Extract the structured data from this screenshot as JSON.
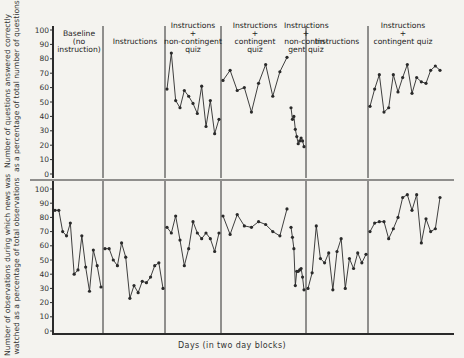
{
  "chart_data": [
    {
      "type": "line",
      "panel": "top",
      "ylabel": "Number of questions answered correctly as a percentage of total number of questions",
      "ylabel_lines": [
        "Number of questions answered correctly",
        "as a percentage of total number of questions"
      ],
      "ylim": [
        0,
        100
      ],
      "yticks": [
        0,
        10,
        20,
        30,
        40,
        50,
        60,
        70,
        80,
        90,
        100
      ],
      "grid": false,
      "phases": [
        {
          "label": "Baseline (no instruction)",
          "values": []
        },
        {
          "label": "Instructions",
          "values": []
        },
        {
          "label": "Instructions + non-contingent quiz",
          "values": [
            59,
            84,
            51,
            46,
            58,
            54,
            49,
            42,
            61,
            33,
            51,
            28,
            38
          ]
        },
        {
          "label": "Instructions + contingent quiz",
          "values": [
            65,
            72,
            58,
            60,
            43,
            63,
            76,
            54,
            71,
            81
          ]
        },
        {
          "label": "Instructions + non-contingent quiz",
          "values": [
            46,
            38,
            40,
            31,
            26,
            21,
            23,
            25,
            23,
            19
          ]
        },
        {
          "label": "Instructions",
          "values": []
        },
        {
          "label": "Instructions + contingent quiz",
          "values": [
            47,
            59,
            69,
            43,
            46,
            69,
            57,
            67,
            76,
            56,
            67,
            64,
            63,
            72,
            75,
            72
          ]
        }
      ]
    },
    {
      "type": "line",
      "panel": "bottom",
      "ylabel": "Number of observations during which news was watched as a percentage of total observations",
      "ylabel_lines": [
        "Number of observations during which news was",
        "watched as a percentage of total observations"
      ],
      "xlabel": "Days (in two day blocks)",
      "ylim": [
        0,
        100
      ],
      "yticks": [
        0,
        10,
        20,
        30,
        40,
        50,
        60,
        70,
        80,
        90,
        100
      ],
      "grid": false,
      "phases": [
        {
          "label": "Baseline (no instruction)",
          "values": [
            85,
            85,
            70,
            67,
            76,
            40,
            43,
            67,
            45,
            28,
            57,
            46,
            31
          ]
        },
        {
          "label": "Instructions",
          "values": [
            58,
            58,
            50,
            46,
            62,
            52,
            23,
            32,
            27,
            35,
            34,
            38,
            46,
            48,
            30
          ]
        },
        {
          "label": "Instructions + non-contingent quiz",
          "values": [
            73,
            69,
            81,
            64,
            46,
            58,
            77,
            69,
            65,
            69,
            65,
            56,
            69
          ]
        },
        {
          "label": "Instructions + contingent quiz",
          "values": [
            81,
            68,
            82,
            74,
            73,
            77,
            75,
            70,
            67,
            86
          ]
        },
        {
          "label": "Instructions + non-contingent quiz",
          "values": [
            73,
            66,
            58,
            32,
            42,
            42,
            43,
            44,
            38,
            29
          ]
        },
        {
          "label": "Instructions",
          "values": [
            30,
            41,
            74,
            51,
            48,
            55,
            29,
            56,
            65,
            30,
            51,
            44,
            55,
            48,
            54
          ]
        },
        {
          "label": "Instructions + contingent quiz",
          "values": [
            70,
            76,
            77,
            77,
            65,
            72,
            80,
            94,
            96,
            85,
            96,
            62,
            79,
            70,
            72,
            94
          ]
        }
      ]
    }
  ],
  "phase_labels": [
    "Baseline\n(no\ninstruction)",
    "Instructions",
    "Instructions\n+\nnon-contingent\nquiz",
    "Instructions\n+\ncontingent\nquiz",
    "Instructions\n+\nnon-contin-\ngent quiz",
    "Instructions",
    "Instructions\n+\ncontingent quiz"
  ],
  "top_ylabel_1": "Number of questions answered correctly",
  "top_ylabel_2": "as a percentage of total number of questions",
  "bottom_ylabel_1": "Number of observations during which news was",
  "bottom_ylabel_2": "watched as a percentage of total observations",
  "xlabel": "Days (in two day blocks)"
}
